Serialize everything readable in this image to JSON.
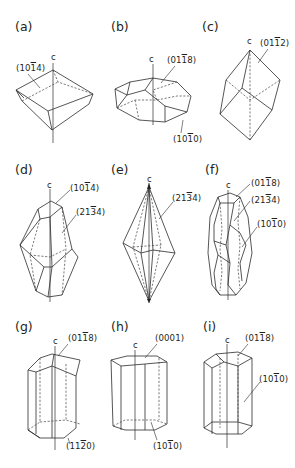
{
  "figure": {
    "axis_label": "c",
    "panels": [
      {
        "id": "a",
        "label": "(a)",
        "indices": [
          {
            "h": "1",
            "k": "0",
            "i": "1",
            "l": "4",
            "bar": "i"
          }
        ],
        "text": [
          "(10̄4)"
        ]
      },
      {
        "id": "b",
        "label": "(b)",
        "text": [
          "(01̄8)",
          "(10̄0)"
        ]
      },
      {
        "id": "c",
        "label": "(c)",
        "text": [
          "(01̄2)"
        ]
      },
      {
        "id": "d",
        "label": "(d)",
        "text": [
          "(10̄4)",
          "(21̄4)"
        ]
      },
      {
        "id": "e",
        "label": "(e)",
        "text": [
          "(21̄4)"
        ]
      },
      {
        "id": "f",
        "label": "(f)",
        "text": [
          "(01̄8)",
          "(21̄4)",
          "(10̄0)"
        ]
      },
      {
        "id": "g",
        "label": "(g)",
        "text": [
          "(01̄8)",
          "(11̄0)"
        ]
      },
      {
        "id": "h",
        "label": "(h)",
        "text": [
          "(0001)",
          "(10̄0)"
        ]
      },
      {
        "id": "i",
        "label": "(i)",
        "text": [
          "(01̄8)",
          "(10̄0)"
        ]
      }
    ],
    "labels": {
      "a": {
        "panel": "(a)",
        "f1_pre": "(10",
        "f1_bar": "1",
        "f1_post": "4)"
      },
      "b": {
        "panel": "(b)",
        "f1_pre": "(01",
        "f1_bar": "1",
        "f1_post": "8)",
        "f2_pre": "(10",
        "f2_bar": "1",
        "f2_post": "0)"
      },
      "c": {
        "panel": "(c)",
        "f1_pre": "(01",
        "f1_bar": "1",
        "f1_post": "2)"
      },
      "d": {
        "panel": "(d)",
        "f1_pre": "(10",
        "f1_bar": "1",
        "f1_post": "4)",
        "f2_pre": "(21",
        "f2_bar": "3",
        "f2_post": "4)"
      },
      "e": {
        "panel": "(e)",
        "f1_pre": "(21",
        "f1_bar": "3",
        "f1_post": "4)"
      },
      "f": {
        "panel": "(f)",
        "f1_pre": "(01",
        "f1_bar": "1",
        "f1_post": "8)",
        "f2_pre": "(21",
        "f2_bar": "3",
        "f2_post": "4)",
        "f3_pre": "(10",
        "f3_bar": "1",
        "f3_post": "0)"
      },
      "g": {
        "panel": "(g)",
        "f1_pre": "(01",
        "f1_bar": "1",
        "f1_post": "8)",
        "f2_pre": "(11",
        "f2_bar": "2",
        "f2_post": "0)"
      },
      "h": {
        "panel": "(h)",
        "f1_text": "(0001)",
        "f2_pre": "(10",
        "f2_bar": "1",
        "f2_post": "0)"
      },
      "i": {
        "panel": "(i)",
        "f1_pre": "(01",
        "f1_bar": "1",
        "f1_post": "8)",
        "f2_pre": "(10",
        "f2_bar": "1",
        "f2_post": "0)"
      }
    }
  }
}
